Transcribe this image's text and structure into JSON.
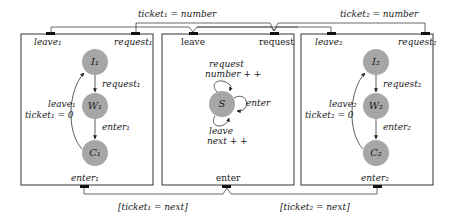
{
  "diagram": {
    "colors": {
      "state_fill": "#a6a6a6",
      "box_stroke": "#333333",
      "port_fill": "#111111"
    },
    "wires": {
      "top_left_label": "ticket₁ = number",
      "top_right_label": "ticket₂ = number",
      "bottom_left_label": "[ticket₁ = next]",
      "bottom_right_label": "[ticket₂ = next]"
    },
    "components": [
      {
        "name": "process-1",
        "ports": {
          "leave": "leave₁",
          "request": "request₁",
          "enter": "enter₁"
        },
        "states": [
          "I₁",
          "W₁",
          "C₁"
        ],
        "transitions": {
          "request": "request₁",
          "enter": "enter₁",
          "leave_line1": "leave₁",
          "leave_line2": "ticket₁ = 0"
        }
      },
      {
        "name": "server",
        "ports": {
          "leave": "leave",
          "request": "request",
          "enter": "enter"
        },
        "states": [
          "S"
        ],
        "transitions": {
          "request_line1": "request",
          "request_line2": "number + +",
          "enter": "enter",
          "leave_line1": "leave",
          "leave_line2": "next + +"
        }
      },
      {
        "name": "process-2",
        "ports": {
          "leave": "leave₂",
          "request": "request₂",
          "enter": "enter₂"
        },
        "states": [
          "I₂",
          "W₂",
          "C₂"
        ],
        "transitions": {
          "request": "request₂",
          "enter": "enter₂",
          "leave_line1": "leave₂",
          "leave_line2": "ticket₂ = 0"
        }
      }
    ]
  }
}
